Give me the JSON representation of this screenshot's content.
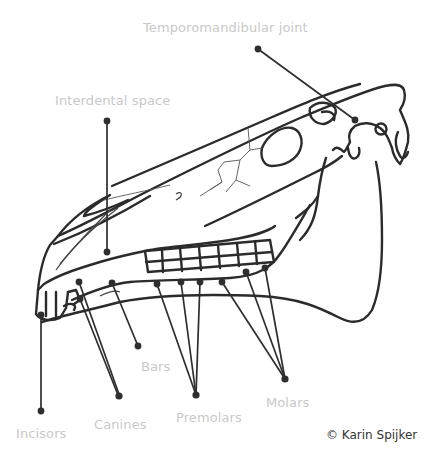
{
  "diagram": {
    "labels": {
      "temporomandibular_joint": "Temporomandibular joint",
      "interdental_space": "Interdental space",
      "incisors": "Incisors",
      "canines": "Canines",
      "bars": "Bars",
      "premolars": "Premolars",
      "molars": "Molars"
    },
    "copyright": "© Karin Spijker",
    "colors": {
      "label_text": "#c9c9c9",
      "line_art": "#2b2b2b",
      "copyright_text": "#333333",
      "background": "#ffffff"
    }
  }
}
